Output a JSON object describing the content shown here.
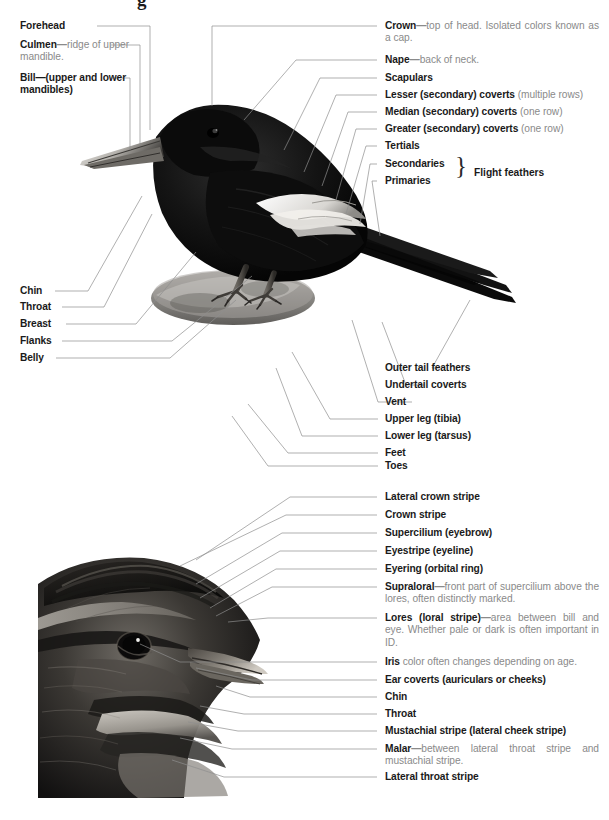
{
  "figures": {
    "bird": {
      "name": "lark-bunting-full-body-photo",
      "alt": "Black bird with white wing patch perched on a rock, side view"
    },
    "head": {
      "name": "sparrow-head-profile-photo",
      "alt": "Close-up profile of a streaked sparrow head facing right"
    }
  },
  "figure1_left_labels": [
    {
      "term": "Forehead",
      "desc": ""
    },
    {
      "term": "Culmen",
      "dash": "—",
      "desc": "ridge of upper mandible."
    },
    {
      "term": "Bill—(upper and lower mandibles)",
      "desc": ""
    },
    {
      "term": "Chin",
      "desc": ""
    },
    {
      "term": "Throat",
      "desc": ""
    },
    {
      "term": "Breast",
      "desc": ""
    },
    {
      "term": "Flanks",
      "desc": ""
    },
    {
      "term": "Belly",
      "desc": ""
    }
  ],
  "figure1_right_labels": [
    {
      "term": "Crown",
      "dash": "—",
      "desc": "top of head. Isolated colors known as a cap."
    },
    {
      "term": "Nape",
      "dash": "—",
      "desc": "back of neck."
    },
    {
      "term": "Scapulars",
      "desc": ""
    },
    {
      "term": "Lesser (secondary) coverts",
      "desc": " (multiple rows)"
    },
    {
      "term": "Median (secondary) coverts",
      "desc": " (one row)"
    },
    {
      "term": "Greater (secondary) coverts",
      "desc": " (one row)"
    },
    {
      "term": "Tertials",
      "desc": ""
    },
    {
      "term": "Secondaries",
      "desc": ""
    },
    {
      "term": "Primaries",
      "desc": ""
    },
    {
      "term": "Outer tail feathers",
      "desc": ""
    },
    {
      "term": "Undertail coverts",
      "desc": ""
    },
    {
      "term": "Vent",
      "desc": ""
    },
    {
      "term": "Upper leg (tibia)",
      "desc": ""
    },
    {
      "term": "Lower leg (tarsus)",
      "desc": ""
    },
    {
      "term": "Feet",
      "desc": ""
    },
    {
      "term": "Toes",
      "desc": ""
    }
  ],
  "flight_feathers_brace": {
    "brace_glyph": "}",
    "label": "Flight feathers"
  },
  "figure2_right_labels": [
    {
      "term": "Lateral crown stripe",
      "desc": ""
    },
    {
      "term": "Crown stripe",
      "desc": ""
    },
    {
      "term": "Supercilium (eyebrow)",
      "desc": ""
    },
    {
      "term": "Eyestripe (eyeline)",
      "desc": ""
    },
    {
      "term": "Eyering (orbital ring)",
      "desc": ""
    },
    {
      "term": "Supraloral",
      "dash": "—",
      "desc": "front part of supercilium above the lores, often distinctly marked."
    },
    {
      "term": "Lores (loral stripe)",
      "dash": "—",
      "desc": "area between bill and eye. Whether pale or dark is often important in ID."
    },
    {
      "term": "Iris",
      "desc": " color often changes depending on age."
    },
    {
      "term": "Ear coverts (auriculars or cheeks)",
      "desc": ""
    },
    {
      "term": "Chin",
      "desc": ""
    },
    {
      "term": "Throat",
      "desc": ""
    },
    {
      "term": "Mustachial stripe (lateral cheek stripe)",
      "desc": ""
    },
    {
      "term": "Malar",
      "dash": "—",
      "desc": "between lateral throat stripe and mustachial stripe."
    },
    {
      "term": "Lateral throat stripe",
      "desc": ""
    }
  ],
  "colors": {
    "term_text": "#1a1a1a",
    "desc_text": "#8a8a8a",
    "leader_line": "#8e8e8e",
    "page_background": "#ffffff"
  }
}
